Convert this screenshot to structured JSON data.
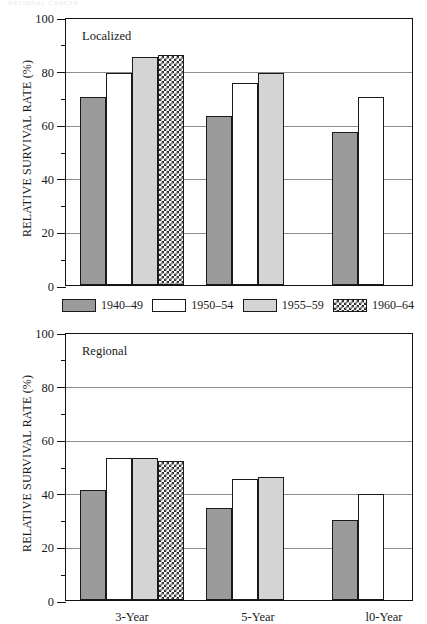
{
  "faint_header": "NATIONAL CANCER",
  "legend": {
    "items": [
      {
        "label": "1940–49",
        "style": "dark"
      },
      {
        "label": "1950–54",
        "style": "white"
      },
      {
        "label": "1955–59",
        "style": "light"
      },
      {
        "label": "1960–64",
        "style": "check"
      }
    ]
  },
  "chart_data": [
    {
      "type": "bar",
      "title": "Localized",
      "panel": "top",
      "xlabel": "",
      "ylabel": "RELATIVE SURVIVAL RATE (%)",
      "ylim": [
        0,
        100
      ],
      "yticks": [
        0,
        20,
        40,
        60,
        80,
        100
      ],
      "yticks_minor": [
        10,
        30,
        50,
        70,
        90
      ],
      "grid": true,
      "legend_position": "below",
      "categories": [
        "3-Year",
        "5-Year",
        "l0-Year"
      ],
      "series": [
        {
          "name": "1940–49",
          "style": "dark",
          "values": [
            70,
            63,
            57
          ]
        },
        {
          "name": "1950–54",
          "style": "white",
          "values": [
            79,
            75.5,
            70
          ]
        },
        {
          "name": "1955–59",
          "style": "light",
          "values": [
            85,
            79,
            null
          ]
        },
        {
          "name": "1960–64",
          "style": "check",
          "values": [
            86,
            null,
            null
          ]
        }
      ]
    },
    {
      "type": "bar",
      "title": "Regional",
      "panel": "bottom",
      "xlabel": "",
      "ylabel": "RELATIVE SURVIVAL RATE (%)",
      "ylim": [
        0,
        100
      ],
      "yticks": [
        0,
        20,
        40,
        60,
        80,
        100
      ],
      "yticks_minor": [
        10,
        30,
        50,
        70,
        90
      ],
      "grid": true,
      "legend_position": "above",
      "categories": [
        "3-Year",
        "5-Year",
        "l0-Year"
      ],
      "series": [
        {
          "name": "1940–49",
          "style": "dark",
          "values": [
            41,
            34.5,
            30
          ]
        },
        {
          "name": "1950–54",
          "style": "white",
          "values": [
            53,
            45,
            39.5
          ]
        },
        {
          "name": "1955–59",
          "style": "light",
          "values": [
            53,
            46,
            null
          ]
        },
        {
          "name": "1960–64",
          "style": "check",
          "values": [
            52,
            null,
            null
          ]
        }
      ]
    }
  ],
  "axis_tick_labels": [
    "0",
    "20",
    "40",
    "60",
    "80",
    "100"
  ],
  "colors": {
    "dark": "#9b9b9b",
    "white": "#ffffff",
    "light": "#d4d4d4",
    "check_ink": "#2b2b2b",
    "grid": "#8d8d8d",
    "axis": "#111111"
  }
}
